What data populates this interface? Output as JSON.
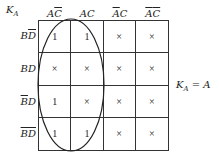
{
  "title": {
    "var": "K",
    "sub": "A"
  },
  "columns": [
    {
      "parts": [
        {
          "t": "A",
          "bar": false
        },
        {
          "t": "C",
          "bar": true
        }
      ]
    },
    {
      "parts": [
        {
          "t": "A",
          "bar": false
        },
        {
          "t": "C",
          "bar": false
        }
      ]
    },
    {
      "parts": [
        {
          "t": "A",
          "bar": true
        },
        {
          "t": "C",
          "bar": false
        }
      ]
    },
    {
      "parts": [
        {
          "t": "A",
          "bar": true
        },
        {
          "t": "C",
          "bar": true
        }
      ]
    }
  ],
  "rows": [
    {
      "parts": [
        {
          "t": "B",
          "bar": false
        },
        {
          "t": "D",
          "bar": true
        }
      ]
    },
    {
      "parts": [
        {
          "t": "B",
          "bar": false
        },
        {
          "t": "D",
          "bar": false
        }
      ]
    },
    {
      "parts": [
        {
          "t": "B",
          "bar": true
        },
        {
          "t": "D",
          "bar": false
        }
      ]
    },
    {
      "parts": [
        {
          "t": "B",
          "bar": true
        },
        {
          "t": "D",
          "bar": true
        }
      ]
    }
  ],
  "cells": [
    [
      "1",
      "1",
      "×",
      "×"
    ],
    [
      "×",
      "×",
      "×",
      "×"
    ],
    [
      "1",
      "×",
      "×",
      "×"
    ],
    [
      "1",
      "1",
      "×",
      "×"
    ]
  ],
  "result": {
    "var": "K",
    "sub": "A",
    "rhs": "= A"
  },
  "loop": {
    "group": "columns 1-2 (A)",
    "color": "#222222"
  }
}
